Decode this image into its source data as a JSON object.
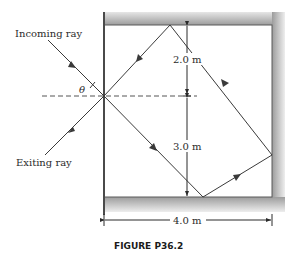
{
  "labels": {
    "incoming_ray": "Incoming ray",
    "exiting_ray": "Exiting ray",
    "theta": "θ",
    "upper_height": "2.0 m",
    "lower_height": "3.0 m",
    "width": "4.0 m",
    "caption": "FIGURE P36.2"
  },
  "colors": {
    "line": "#3a3a3a",
    "mirror_shade": "#a8a8a8",
    "text": "#2b2b2b"
  },
  "geometry": {
    "room_width_m": 4.0,
    "height_above_axis_m": 2.0,
    "height_below_axis_m": 3.0
  }
}
